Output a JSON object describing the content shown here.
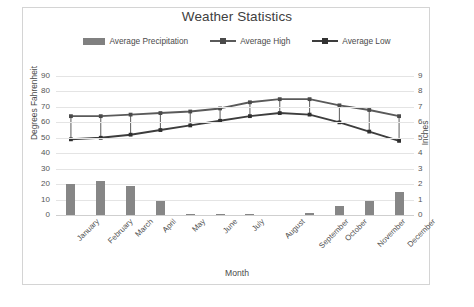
{
  "chart_data": {
    "type": "bar",
    "title": "Weather Statistics",
    "xlabel": "Month",
    "ylabel": "Degrees Fahrenheit",
    "y2label": "Inches",
    "categories": [
      "January",
      "February",
      "March",
      "April",
      "May",
      "June",
      "July",
      "August",
      "September",
      "October",
      "November",
      "December"
    ],
    "ylim": [
      0,
      90
    ],
    "y2lim": [
      0,
      9
    ],
    "yticks": [
      90,
      80,
      70,
      60,
      50,
      40,
      30,
      20,
      10,
      0
    ],
    "y2ticks": [
      9,
      8,
      7,
      6,
      5,
      4,
      3,
      2,
      1,
      0
    ],
    "grid": true,
    "legend_position": "top",
    "series": [
      {
        "name": "Average Precipitation",
        "type": "bar",
        "axis": "right",
        "unit": "inches",
        "color": "#868686",
        "values": [
          2.0,
          2.2,
          1.9,
          0.9,
          0.05,
          0.05,
          0.05,
          0.0,
          0.15,
          0.6,
          0.9,
          1.5
        ]
      },
      {
        "name": "Average High",
        "type": "line",
        "axis": "left",
        "unit": "degrees_fahrenheit",
        "color": "#5a5a5a",
        "values": [
          64,
          64,
          65,
          66,
          67,
          69,
          73,
          75,
          75,
          71,
          68,
          64
        ]
      },
      {
        "name": "Average Low",
        "type": "line",
        "axis": "left",
        "unit": "degrees_fahrenheit",
        "color": "#3d3d3d",
        "values": [
          49,
          50,
          52,
          55,
          58,
          61,
          64,
          66,
          65,
          60,
          54,
          48
        ]
      }
    ]
  },
  "colors": {
    "bar": "#868686",
    "high_line": "#5a5a5a",
    "low_line": "#3d3d3d",
    "grid": "#e4e4e4",
    "frame": "#d4d4d4"
  }
}
